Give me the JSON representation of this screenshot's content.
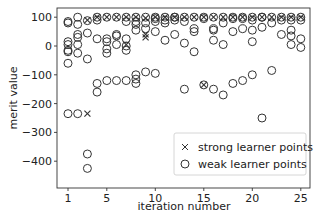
{
  "chart_data": {
    "type": "scatter",
    "title": "",
    "xlabel": "iteration number",
    "ylabel": "merit value",
    "xlim": [
      0,
      26.3
    ],
    "ylim": [
      -460,
      115
    ],
    "xticks": [
      1,
      5,
      10,
      15,
      20,
      25
    ],
    "yticks": [
      100,
      0,
      -100,
      -200,
      -300,
      -400
    ],
    "grid": false,
    "legend_position": "lower right",
    "legend": [
      {
        "marker": "x",
        "label": "strong learner points"
      },
      {
        "marker": "o",
        "label": "weak learner points"
      }
    ],
    "series": [
      {
        "name": "strong learner points",
        "marker": "x",
        "points": [
          [
            3,
            90
          ],
          [
            3,
            -235
          ],
          [
            4,
            100
          ],
          [
            5,
            100
          ],
          [
            6,
            100
          ],
          [
            7,
            100
          ],
          [
            7,
            5
          ],
          [
            8,
            100
          ],
          [
            9,
            97
          ],
          [
            9,
            40
          ],
          [
            9,
            30
          ],
          [
            10,
            100
          ],
          [
            11,
            100
          ],
          [
            12,
            100
          ],
          [
            13,
            100
          ],
          [
            14,
            100
          ],
          [
            15,
            100
          ],
          [
            15,
            -135
          ],
          [
            16,
            100
          ],
          [
            17,
            100
          ],
          [
            18,
            100
          ],
          [
            19,
            100
          ],
          [
            20,
            100
          ],
          [
            21,
            100
          ],
          [
            22,
            100
          ],
          [
            23,
            100
          ],
          [
            24,
            100
          ],
          [
            25,
            100
          ]
        ]
      },
      {
        "name": "weak learner points",
        "marker": "o",
        "points": [
          [
            1,
            80
          ],
          [
            1,
            85
          ],
          [
            1,
            15
          ],
          [
            1,
            5
          ],
          [
            1,
            -15
          ],
          [
            1,
            -20
          ],
          [
            1,
            -60
          ],
          [
            1,
            -235
          ],
          [
            2,
            100
          ],
          [
            2,
            75
          ],
          [
            2,
            40
          ],
          [
            2,
            30
          ],
          [
            2,
            5
          ],
          [
            2,
            -25
          ],
          [
            2,
            -235
          ],
          [
            3,
            88
          ],
          [
            3,
            45
          ],
          [
            3,
            -45
          ],
          [
            3,
            -375
          ],
          [
            3,
            -425
          ],
          [
            4,
            100
          ],
          [
            4,
            90
          ],
          [
            4,
            25
          ],
          [
            4,
            -130
          ],
          [
            4,
            -160
          ],
          [
            5,
            100
          ],
          [
            5,
            25
          ],
          [
            5,
            15
          ],
          [
            5,
            -10
          ],
          [
            5,
            -25
          ],
          [
            5,
            -120
          ],
          [
            6,
            100
          ],
          [
            6,
            40
          ],
          [
            6,
            35
          ],
          [
            6,
            5
          ],
          [
            6,
            -120
          ],
          [
            7,
            100
          ],
          [
            7,
            85
          ],
          [
            7,
            25
          ],
          [
            7,
            0
          ],
          [
            7,
            -15
          ],
          [
            7,
            -120
          ],
          [
            8,
            100
          ],
          [
            8,
            85
          ],
          [
            8,
            75
          ],
          [
            8,
            55
          ],
          [
            8,
            -100
          ],
          [
            8,
            -115
          ],
          [
            8,
            -130
          ],
          [
            9,
            100
          ],
          [
            9,
            80
          ],
          [
            9,
            60
          ],
          [
            9,
            -90
          ],
          [
            10,
            100
          ],
          [
            10,
            95
          ],
          [
            10,
            85
          ],
          [
            10,
            50
          ],
          [
            10,
            -95
          ],
          [
            11,
            100
          ],
          [
            11,
            90
          ],
          [
            11,
            80
          ],
          [
            11,
            20
          ],
          [
            12,
            100
          ],
          [
            12,
            100
          ],
          [
            12,
            90
          ],
          [
            12,
            40
          ],
          [
            13,
            100
          ],
          [
            13,
            85
          ],
          [
            13,
            10
          ],
          [
            13,
            -150
          ],
          [
            14,
            100
          ],
          [
            14,
            60
          ],
          [
            14,
            50
          ],
          [
            14,
            -20
          ],
          [
            15,
            100
          ],
          [
            15,
            95
          ],
          [
            15,
            -135
          ],
          [
            16,
            100
          ],
          [
            16,
            60
          ],
          [
            16,
            55
          ],
          [
            16,
            20
          ],
          [
            16,
            -150
          ],
          [
            17,
            100
          ],
          [
            17,
            80
          ],
          [
            17,
            5
          ],
          [
            17,
            -170
          ],
          [
            18,
            100
          ],
          [
            18,
            95
          ],
          [
            18,
            50
          ],
          [
            18,
            -130
          ],
          [
            19,
            100
          ],
          [
            19,
            95
          ],
          [
            19,
            60
          ],
          [
            19,
            -120
          ],
          [
            20,
            100
          ],
          [
            20,
            90
          ],
          [
            20,
            55
          ],
          [
            20,
            15
          ],
          [
            20,
            -100
          ],
          [
            21,
            100
          ],
          [
            21,
            100
          ],
          [
            21,
            65
          ],
          [
            21,
            -250
          ],
          [
            22,
            100
          ],
          [
            22,
            80
          ],
          [
            22,
            -85
          ],
          [
            23,
            100
          ],
          [
            23,
            90
          ],
          [
            23,
            40
          ],
          [
            24,
            100
          ],
          [
            24,
            90
          ],
          [
            24,
            55
          ],
          [
            24,
            35
          ],
          [
            24,
            5
          ],
          [
            25,
            100
          ],
          [
            25,
            90
          ],
          [
            25,
            25
          ],
          [
            25,
            -5
          ]
        ]
      }
    ]
  },
  "axes": {
    "xlabel": "iteration number",
    "ylabel": "merit value",
    "xtick_labels": [
      "1",
      "5",
      "10",
      "15",
      "20",
      "25"
    ],
    "ytick_labels": [
      "100",
      "0",
      "−100",
      "−200",
      "−300",
      "−400"
    ]
  },
  "legend": {
    "strong_label": "strong learner points",
    "weak_label": "weak learner points",
    "strong_marker": "×",
    "weak_marker": "○"
  },
  "colors": {
    "marker": "#333333",
    "axis": "#333333",
    "legend_border": "#cccccc"
  }
}
